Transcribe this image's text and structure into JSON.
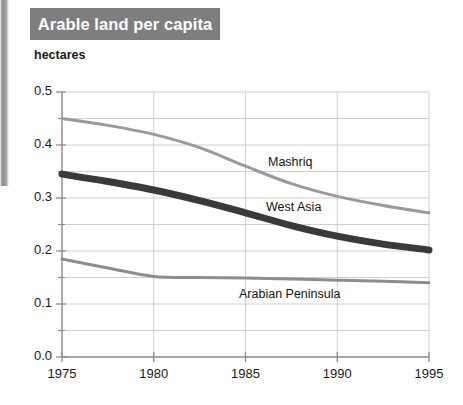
{
  "banner": {
    "title": "Arable land per capita"
  },
  "axis_unit_label": "hectares",
  "series_labels": {
    "mashriq": "Mashriq",
    "west_asia": "West Asia",
    "arabian_peninsula": "Arabian Peninsula"
  },
  "colors": {
    "banner_background": "#7e7e7e",
    "banner_text": "#ffffff",
    "mashriq": "#9a9a9a",
    "west_asia": "#3a3a3a",
    "arabian_peninsula": "#8d8d8d",
    "gridline": "#cfcfcf",
    "axis": "#8c8c8c",
    "text": "#1a1a1a"
  },
  "chart_data": {
    "type": "line",
    "title": "Arable land per capita",
    "xlabel": "",
    "ylabel": "hectares",
    "xlim": [
      1975,
      1995
    ],
    "ylim": [
      0.0,
      0.5
    ],
    "grid": true,
    "legend_position": "inline-labels",
    "y_ticks_major": [
      "0.0",
      "0.1",
      "0.2",
      "0.3",
      "0.4",
      "0.5"
    ],
    "y_ticks_minor": [
      0.05,
      0.15,
      0.25,
      0.35,
      0.45
    ],
    "x_ticks": [
      "1975",
      "1980",
      "1985",
      "1990",
      "1995"
    ],
    "x": [
      1975,
      1977.5,
      1980,
      1982.5,
      1985,
      1987.5,
      1990,
      1992.5,
      1995
    ],
    "series": [
      {
        "name": "Mashriq",
        "color": "#9a9a9a",
        "line_width": 3,
        "values": [
          0.45,
          0.437,
          0.42,
          0.395,
          0.36,
          0.327,
          0.303,
          0.286,
          0.272
        ]
      },
      {
        "name": "West Asia",
        "color": "#3a3a3a",
        "line_width": 7,
        "values": [
          0.345,
          0.331,
          0.315,
          0.295,
          0.272,
          0.248,
          0.228,
          0.213,
          0.202
        ]
      },
      {
        "name": "Arabian Peninsula",
        "color": "#8d8d8d",
        "line_width": 3,
        "values": [
          0.185,
          0.168,
          0.152,
          0.15,
          0.149,
          0.147,
          0.145,
          0.143,
          0.14
        ]
      }
    ]
  },
  "plot_geometry": {
    "left": 62,
    "right": 429,
    "top": 92,
    "bottom": 357
  },
  "annotations": [
    {
      "key": "mashriq",
      "text": "Mashriq",
      "x": 268,
      "y": 155
    },
    {
      "key": "west_asia",
      "text": "West Asia",
      "x": 266,
      "y": 200
    },
    {
      "key": "arabian_peninsula",
      "text": "Arabian Peninsula",
      "x": 239,
      "y": 287
    }
  ]
}
